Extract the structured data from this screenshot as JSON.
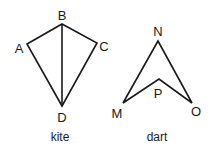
{
  "figures": [
    {
      "caption": "kite",
      "vertices": [
        {
          "label": "A",
          "x": 27,
          "y": 44,
          "lx": 19,
          "ly": 53
        },
        {
          "label": "B",
          "x": 62,
          "y": 24,
          "lx": 62,
          "ly": 19
        },
        {
          "label": "C",
          "x": 97,
          "y": 43,
          "lx": 104,
          "ly": 51
        },
        {
          "label": "D",
          "x": 62,
          "y": 106,
          "lx": 62,
          "ly": 122
        }
      ]
    },
    {
      "caption": "dart",
      "vertices": [
        {
          "label": "N",
          "x": 158,
          "y": 41,
          "lx": 158,
          "ly": 36
        },
        {
          "label": "O",
          "x": 192,
          "y": 103,
          "lx": 196,
          "ly": 116
        },
        {
          "label": "P",
          "x": 159,
          "y": 79,
          "lx": 158,
          "ly": 98
        },
        {
          "label": "M",
          "x": 123,
          "y": 103,
          "lx": 117,
          "ly": 118
        }
      ]
    }
  ],
  "stroke_color": "#1a1a1a"
}
